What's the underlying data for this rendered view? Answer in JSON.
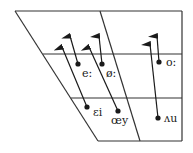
{
  "diagram": {
    "type": "vowel-trapezoid",
    "colors": {
      "line": "#333333",
      "arrow": "#1a1a1a",
      "background": "#ffffff"
    },
    "vowels": [
      {
        "label": "e:",
        "x": 78,
        "y": 64,
        "tx": 72,
        "ty": 68
      },
      {
        "label": "ø:",
        "x": 102,
        "y": 64,
        "tx": 112,
        "ty": 68
      },
      {
        "label": "o:",
        "x": 159,
        "y": 62,
        "tx": 165,
        "ty": 66
      },
      {
        "label": "ɛi",
        "x": 87,
        "y": 107,
        "tx": 94,
        "ty": 112
      },
      {
        "label": "œy",
        "x": 118,
        "y": 111,
        "tx": 112,
        "ty": 124
      },
      {
        "label": "ʌu",
        "x": 158,
        "y": 118,
        "tx": 165,
        "ty": 122
      }
    ]
  }
}
